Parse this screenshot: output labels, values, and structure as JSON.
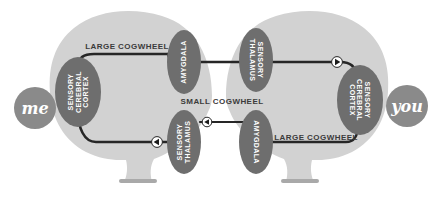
{
  "diagram": {
    "colors": {
      "background": "#ffffff",
      "brain_fill": "#d2d2d2",
      "brain_stem_fill": "#c6c6c6",
      "stem_base_fill": "#a9a9a9",
      "node_fill": "#6e6e6e",
      "badge_fill": "#8a8a8a",
      "edge_stroke": "#262626",
      "edge_label": "#3b3b3b",
      "node_text": "#ffffff",
      "arrow_disc": "#ffffff",
      "arrow_head": "#1b1b1b"
    },
    "persons": [
      {
        "id": "me",
        "label": "me",
        "side": "left"
      },
      {
        "id": "you",
        "label": "you",
        "side": "right"
      }
    ],
    "nodes": [
      {
        "id": "left-cortex",
        "label_lines": [
          "SENSORY",
          "CEREBRAL",
          "CORTEX"
        ],
        "orientation": "ccw"
      },
      {
        "id": "left-amygdala",
        "label_lines": [
          "AMYGDALA"
        ],
        "orientation": "ccw"
      },
      {
        "id": "left-thalamus",
        "label_lines": [
          "SENSORY",
          "THALAMUS"
        ],
        "orientation": "ccw"
      },
      {
        "id": "right-thalamus",
        "label_lines": [
          "SENSORY",
          "THALAMUS"
        ],
        "orientation": "cw"
      },
      {
        "id": "right-cortex",
        "label_lines": [
          "SENSORY",
          "CEREBRAL",
          "CORTEX"
        ],
        "orientation": "cw"
      },
      {
        "id": "right-amygdala",
        "label_lines": [
          "AMYGDALA"
        ],
        "orientation": "cw"
      }
    ],
    "edges": [
      {
        "id": "top-large-cogwheel",
        "label": "LARGE COGWHEEL",
        "from": "left-cortex",
        "to": "left-amygdala"
      },
      {
        "id": "upper-transfer",
        "label": "",
        "from": "left-amygdala",
        "to": "right-thalamus"
      },
      {
        "id": "right-down",
        "label": "",
        "from": "right-thalamus",
        "to": "right-cortex"
      },
      {
        "id": "middle-small-cogwheel",
        "label": "SMALL COGWHEEL",
        "from": "left-thalamus",
        "to": "right-amygdala"
      },
      {
        "id": "bottom-large-cogwheel",
        "label": "LARGE COGWHEEL",
        "from": "right-amygdala",
        "to": "right-cortex"
      },
      {
        "id": "left-down",
        "label": "",
        "from": "left-cortex",
        "to": "left-thalamus"
      }
    ],
    "edge_labels": [
      {
        "id": "label-large-cogwheel-top",
        "text": "LARGE COGWHEEL",
        "x": 127,
        "y": 46
      },
      {
        "id": "label-small-cogwheel-center",
        "text": "SMALL COGWHEEL",
        "x": 222,
        "y": 101
      },
      {
        "id": "label-large-cogwheel-bottom",
        "text": "LARGE COGWHEEL",
        "x": 316,
        "y": 137
      }
    ]
  }
}
